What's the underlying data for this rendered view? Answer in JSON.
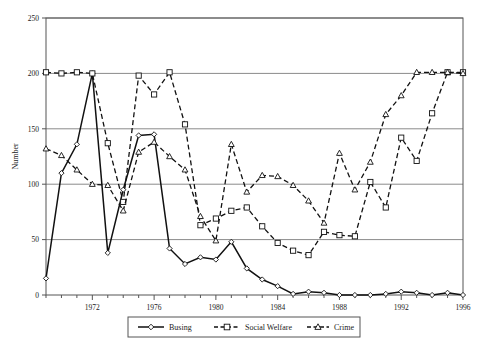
{
  "chart_data": {
    "type": "line",
    "title": "",
    "xlabel": "Year",
    "ylabel": "Number",
    "xlim": [
      1969,
      1996
    ],
    "ylim": [
      0,
      250
    ],
    "ytick_labels": [
      "0",
      "50",
      "100",
      "150",
      "200",
      "250"
    ],
    "yticks": [
      0,
      50,
      100,
      150,
      200,
      250
    ],
    "xtick_labels": [
      "1972",
      "1976",
      "1980",
      "1984",
      "1988",
      "1992",
      "1996"
    ],
    "xticks": [
      1972,
      1976,
      1980,
      1984,
      1988,
      1992,
      1996
    ],
    "grid": "horizontal",
    "legend_position": "bottom",
    "x": [
      1969,
      1970,
      1971,
      1972,
      1973,
      1974,
      1975,
      1976,
      1977,
      1978,
      1979,
      1980,
      1981,
      1982,
      1983,
      1984,
      1985,
      1986,
      1987,
      1988,
      1989,
      1990,
      1991,
      1992,
      1993,
      1994,
      1995,
      1996
    ],
    "series": [
      {
        "name": "Busing",
        "marker": "diamond",
        "line_style": "solid",
        "color": "#111111",
        "values": [
          15,
          110,
          136,
          200,
          38,
          95,
          144,
          145,
          42,
          28,
          34,
          32,
          48,
          24,
          14,
          8,
          1,
          3,
          2,
          0,
          0,
          0,
          1,
          3,
          2,
          0,
          2,
          0
        ]
      },
      {
        "name": "Social Welfare",
        "marker": "square",
        "line_style": "dashed",
        "color": "#111111",
        "values": [
          201,
          200,
          201,
          200,
          137,
          84,
          198,
          181,
          201,
          154,
          63,
          69,
          76,
          79,
          62,
          47,
          40,
          36,
          57,
          54,
          53,
          102,
          79,
          142,
          121,
          164,
          201,
          201
        ]
      },
      {
        "name": "Crime",
        "marker": "triangle",
        "line_style": "dashed",
        "color": "#111111",
        "values": [
          132,
          126,
          113,
          100,
          99,
          76,
          129,
          138,
          125,
          113,
          71,
          49,
          136,
          93,
          108,
          107,
          99,
          85,
          65,
          128,
          95,
          120,
          163,
          180,
          201,
          201,
          201,
          200
        ]
      }
    ]
  },
  "legend": {
    "items": [
      {
        "label": "Busing",
        "marker": "diamond",
        "style": "solid"
      },
      {
        "label": "Social Welfare",
        "marker": "square",
        "style": "dashed"
      },
      {
        "label": "Crime",
        "marker": "triangle",
        "style": "dashed"
      }
    ]
  }
}
